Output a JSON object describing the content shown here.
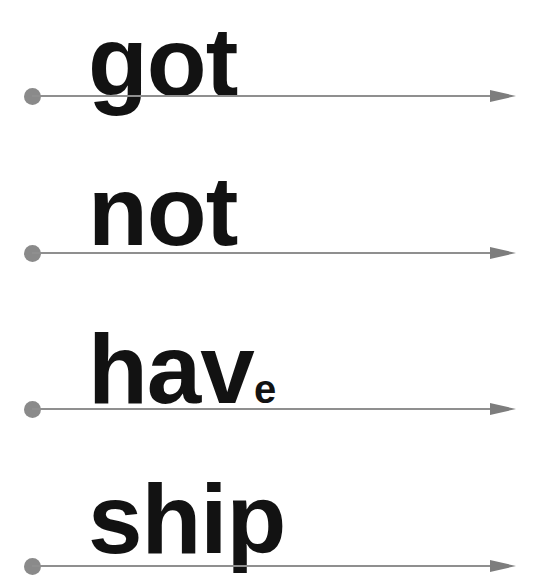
{
  "rows": [
    {
      "word": "got",
      "suffix": ""
    },
    {
      "word": "not",
      "suffix": ""
    },
    {
      "word": "hav",
      "suffix": "e"
    },
    {
      "word": "ship",
      "suffix": ""
    }
  ],
  "colors": {
    "text": "#121212",
    "line": "#8f8f8f",
    "dot": "#8a8a8a",
    "arrow": "#7d7d7d"
  }
}
